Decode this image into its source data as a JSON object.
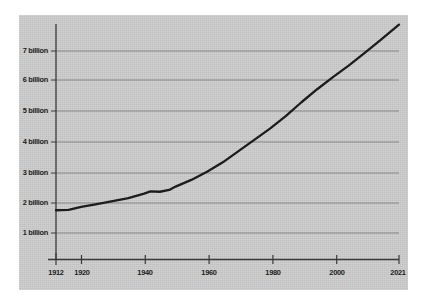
{
  "chart_data": {
    "type": "line",
    "title": "",
    "subtitle": "",
    "xlabel": "",
    "ylabel": "",
    "xlim": [
      1912,
      2021
    ],
    "ylim": [
      0.35,
      7.9
    ],
    "grid": true,
    "legend": null,
    "y_tick_labels": [
      "7 billion",
      "6 billion",
      "5 billion",
      "4 billion",
      "3 billion",
      "2 billion",
      "1 billion"
    ],
    "y_tick_values": [
      7,
      6,
      5,
      4,
      3,
      2,
      1
    ],
    "x_tick_labels": [
      "1912",
      "1920",
      "1940",
      "1960",
      "1980",
      "2000",
      "2021"
    ],
    "x_tick_values": [
      1912,
      1920,
      1940,
      1960,
      1980,
      2000,
      2021
    ],
    "series": [
      {
        "name": "World population",
        "color": "#1c1c1c",
        "x": [
          1912,
          1916,
          1920,
          1925,
          1930,
          1935,
          1940,
          1942,
          1945,
          1948,
          1950,
          1955,
          1960,
          1965,
          1970,
          1975,
          1980,
          1985,
          1990,
          1995,
          2000,
          2005,
          2010,
          2015,
          2021
        ],
        "values": [
          1.75,
          1.76,
          1.86,
          1.95,
          2.05,
          2.15,
          2.3,
          2.37,
          2.36,
          2.42,
          2.53,
          2.75,
          3.02,
          3.33,
          3.7,
          4.07,
          4.44,
          4.85,
          5.31,
          5.74,
          6.14,
          6.52,
          6.93,
          7.35,
          7.87
        ]
      }
    ]
  },
  "axes": {
    "y_ticks": [
      {
        "label": "7 billion",
        "value": 7
      },
      {
        "label": "6 billion",
        "value": 6
      },
      {
        "label": "5 billion",
        "value": 5
      },
      {
        "label": "4 billion",
        "value": 4
      },
      {
        "label": "3 billion",
        "value": 3
      },
      {
        "label": "2 billion",
        "value": 2
      },
      {
        "label": "1 billion",
        "value": 1
      }
    ],
    "x_ticks": [
      {
        "label": "1912",
        "value": 1912
      },
      {
        "label": "1920",
        "value": 1920
      },
      {
        "label": "1940",
        "value": 1940
      },
      {
        "label": "1960",
        "value": 1960
      },
      {
        "label": "1980",
        "value": 1980
      },
      {
        "label": "2000",
        "value": 2000
      },
      {
        "label": "2021",
        "value": 2021
      }
    ]
  },
  "style": {
    "panel_color": "#cdcdcd",
    "page_color": "#ffffff",
    "line_color": "#1c1c1c",
    "grid_color": "#7d7d7d",
    "axis_color": "#3a3a3a",
    "text_color": "#1a1a1a"
  }
}
